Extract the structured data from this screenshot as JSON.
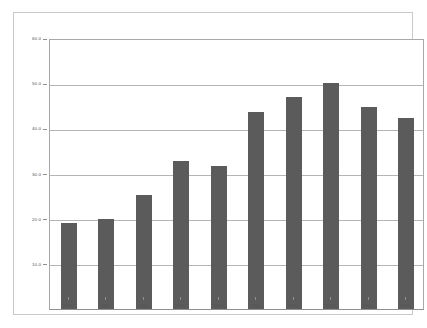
{
  "chart_data": {
    "type": "bar",
    "title": "",
    "subtitle": "",
    "xlabel": "",
    "ylabel": "",
    "categories": [
      "1900",
      "1910",
      "1920",
      "1930",
      "1940",
      "1950",
      "1960",
      "1970",
      "1980",
      "1990"
    ],
    "values": [
      19.0,
      20.0,
      25.2,
      32.7,
      31.7,
      43.6,
      47.0,
      50.0,
      44.8,
      42.2
    ],
    "ylim": [
      0,
      60
    ],
    "xlim_note": "categorical",
    "yticks": [
      10,
      20,
      30,
      40,
      50,
      60
    ],
    "ytick_labels": [
      "10.0",
      "20.0",
      "30.0",
      "40.0",
      "50.0",
      "60.0"
    ],
    "grid": "horizontal",
    "legend": "none",
    "series": [
      {
        "name": "",
        "values": [
          19.0,
          20.0,
          25.2,
          32.7,
          31.7,
          43.6,
          47.0,
          50.0,
          44.8,
          42.2
        ]
      }
    ],
    "colors": {
      "bar": "#5b5b5b",
      "gridline": "#b5b5b5",
      "axis": "#8f8f8f",
      "frame": "#c9c9c9",
      "background": "#ffffff",
      "tick_label": "#555555"
    }
  }
}
